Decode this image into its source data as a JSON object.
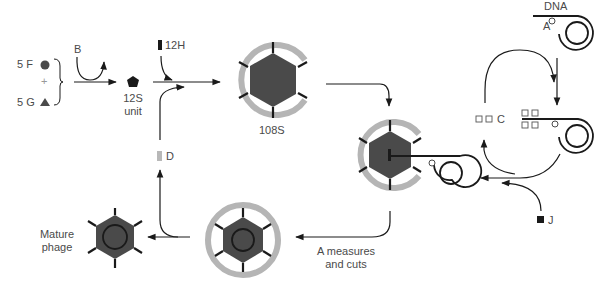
{
  "diagram": {
    "colors": {
      "ink": "#1a1a1a",
      "head_fill": "#4a4a4a",
      "scaffold_ring": "#b5b5b5",
      "label": "#4a4a4a",
      "light_block": "#b8b8b8"
    },
    "labels": {
      "f_protein": "5 F",
      "plus": "+",
      "g_protein": "5 G",
      "b_protein": "B",
      "unit_12s_line1": "12S",
      "unit_12s_line2": "unit",
      "h_protein": "12H",
      "d_protein": "D",
      "particle_108s": "108S",
      "dna": "DNA",
      "a_protein": "A",
      "c_protein": "C",
      "j_protein": "J",
      "a_measures_line1": "A measures",
      "a_measures_line2": "and cuts",
      "mature_line1": "Mature",
      "mature_line2": "phage"
    },
    "icons": {
      "f_protein": "filled-circle-icon",
      "g_protein": "filled-triangle-icon",
      "unit_12s": "pentagon-icon",
      "h_protein": "black-bar-icon",
      "d_protein": "gray-bar-icon",
      "c_protein": "open-square-icon",
      "j_protein": "filled-square-icon",
      "a_protein": "open-circle-icon"
    }
  }
}
